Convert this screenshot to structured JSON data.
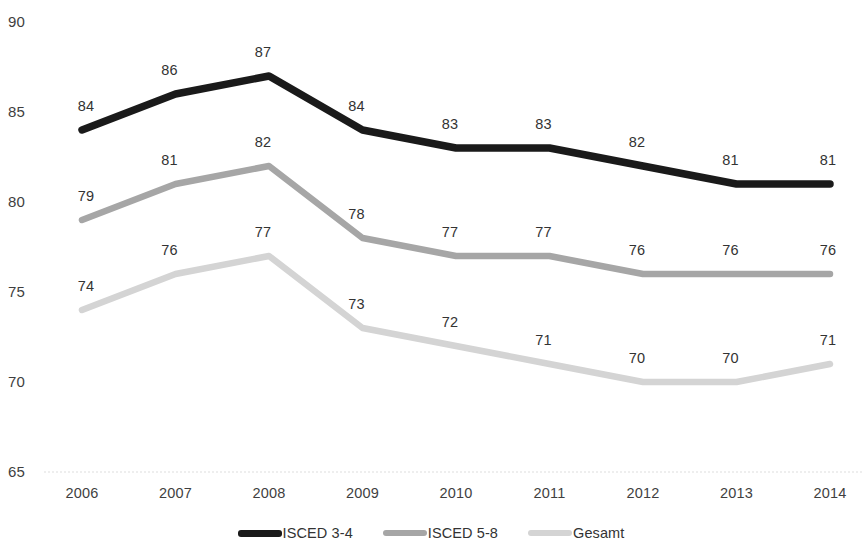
{
  "chart_data": {
    "type": "line",
    "title": "",
    "subtitle": "",
    "xlabel": "",
    "ylabel": "",
    "categories": [
      "2006",
      "2007",
      "2008",
      "2009",
      "2010",
      "2011",
      "2012",
      "2013",
      "2014"
    ],
    "ylim": [
      65,
      90
    ],
    "yticks": [
      90,
      85,
      80,
      75,
      70,
      65
    ],
    "grid": "dotted baseline at 65 only",
    "legend_position": "bottom-center",
    "data_labels": true,
    "series": [
      {
        "name": "ISCED 3-4",
        "color": "#1a1a1a",
        "values": [
          84,
          86,
          87,
          84,
          83,
          83,
          82,
          81,
          81
        ]
      },
      {
        "name": "ISCED 5-8",
        "color": "#a6a6a6",
        "values": [
          79,
          81,
          82,
          78,
          77,
          77,
          76,
          76,
          76
        ]
      },
      {
        "name": "Gesamt",
        "color": "#d4d4d4",
        "values": [
          74,
          76,
          77,
          73,
          72,
          71,
          70,
          70,
          71
        ]
      }
    ]
  },
  "legend": {
    "items": [
      {
        "label": "ISCED 3-4",
        "color": "#1a1a1a"
      },
      {
        "label": "ISCED 5-8",
        "color": "#a6a6a6"
      },
      {
        "label": "Gesamt",
        "color": "#d4d4d4"
      }
    ]
  },
  "axes": {
    "y_tick_labels": [
      "90",
      "85",
      "80",
      "75",
      "70",
      "65"
    ],
    "x_tick_labels": [
      "2006",
      "2007",
      "2008",
      "2009",
      "2010",
      "2011",
      "2012",
      "2013",
      "2014"
    ]
  }
}
